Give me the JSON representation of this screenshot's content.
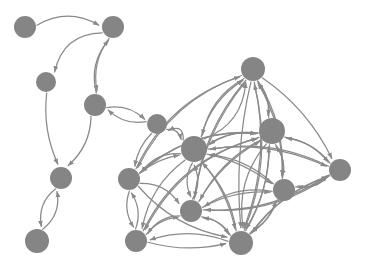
{
  "figure": {
    "type": "directed-graph",
    "title": "",
    "background_color": "#ffffff",
    "node_color": "#858585",
    "edge_color": "#8a8a8a",
    "width": 367,
    "height": 266,
    "node_count": 16,
    "edge_count": 74,
    "directed": true
  },
  "graph_data": {
    "type": "graph",
    "nodes": [
      {
        "id": "n1",
        "label": "",
        "x": 25,
        "y": 27,
        "r": 11
      },
      {
        "id": "n2",
        "label": "",
        "x": 113,
        "y": 27,
        "r": 11
      },
      {
        "id": "n3",
        "label": "",
        "x": 46,
        "y": 82,
        "r": 10
      },
      {
        "id": "n4",
        "label": "",
        "x": 95,
        "y": 105,
        "r": 11
      },
      {
        "id": "n5",
        "label": "",
        "x": 61,
        "y": 178,
        "r": 11
      },
      {
        "id": "n6",
        "label": "",
        "x": 37,
        "y": 241,
        "r": 12
      },
      {
        "id": "n7",
        "label": "",
        "x": 157,
        "y": 124,
        "r": 10
      },
      {
        "id": "n8",
        "label": "",
        "x": 194,
        "y": 149,
        "r": 13
      },
      {
        "id": "n9",
        "label": "",
        "x": 129,
        "y": 179,
        "r": 11
      },
      {
        "id": "n10",
        "label": "",
        "x": 136,
        "y": 241,
        "r": 11
      },
      {
        "id": "n11",
        "label": "",
        "x": 253,
        "y": 69,
        "r": 12
      },
      {
        "id": "n12",
        "label": "",
        "x": 272,
        "y": 131,
        "r": 13
      },
      {
        "id": "n13",
        "label": "",
        "x": 340,
        "y": 170,
        "r": 11
      },
      {
        "id": "n14",
        "label": "",
        "x": 284,
        "y": 190,
        "r": 11
      },
      {
        "id": "n15",
        "label": "",
        "x": 191,
        "y": 211,
        "r": 11
      },
      {
        "id": "n16",
        "label": "",
        "x": 241,
        "y": 243,
        "r": 12
      }
    ],
    "edges": [
      {
        "from": "n1",
        "to": "n2",
        "curve": -18
      },
      {
        "from": "n2",
        "to": "n3",
        "curve": 24
      },
      {
        "from": "n4",
        "to": "n2",
        "curve": -14
      },
      {
        "from": "n2",
        "to": "n4",
        "curve": 12
      },
      {
        "from": "n3",
        "to": "n5",
        "curve": 10
      },
      {
        "from": "n4",
        "to": "n5",
        "curve": -12
      },
      {
        "from": "n5",
        "to": "n6",
        "curve": 12
      },
      {
        "from": "n6",
        "to": "n5",
        "curve": 12
      },
      {
        "from": "n7",
        "to": "n4",
        "curve": -10
      },
      {
        "from": "n4",
        "to": "n7",
        "curve": -10
      },
      {
        "from": "n8",
        "to": "n7",
        "curve": 14
      },
      {
        "from": "n7",
        "to": "n9",
        "curve": 6
      },
      {
        "from": "n8",
        "to": "n9",
        "curve": 12
      },
      {
        "from": "n9",
        "to": "n8",
        "curve": -6
      },
      {
        "from": "n9",
        "to": "n10",
        "curve": 9
      },
      {
        "from": "n10",
        "to": "n9",
        "curve": 9
      },
      {
        "from": "n10",
        "to": "n15",
        "curve": -8
      },
      {
        "from": "n15",
        "to": "n10",
        "curve": 10
      },
      {
        "from": "n8",
        "to": "n15",
        "curve": 9
      },
      {
        "from": "n15",
        "to": "n8",
        "curve": 9
      },
      {
        "from": "n8",
        "to": "n11",
        "curve": -14
      },
      {
        "from": "n11",
        "to": "n8",
        "curve": 16
      },
      {
        "from": "n8",
        "to": "n12",
        "curve": -10
      },
      {
        "from": "n12",
        "to": "n8",
        "curve": 10
      },
      {
        "from": "n8",
        "to": "n13",
        "curve": -18
      },
      {
        "from": "n13",
        "to": "n8",
        "curve": 20
      },
      {
        "from": "n8",
        "to": "n14",
        "curve": -8
      },
      {
        "from": "n14",
        "to": "n8",
        "curve": 12
      },
      {
        "from": "n8",
        "to": "n16",
        "curve": -10
      },
      {
        "from": "n16",
        "to": "n8",
        "curve": 12
      },
      {
        "from": "n11",
        "to": "n12",
        "curve": -8
      },
      {
        "from": "n12",
        "to": "n11",
        "curve": 8
      },
      {
        "from": "n11",
        "to": "n14",
        "curve": -16
      },
      {
        "from": "n14",
        "to": "n11",
        "curve": 14
      },
      {
        "from": "n11",
        "to": "n16",
        "curve": -22
      },
      {
        "from": "n16",
        "to": "n11",
        "curve": 24
      },
      {
        "from": "n11",
        "to": "n15",
        "curve": 20
      },
      {
        "from": "n15",
        "to": "n11",
        "curve": -18
      },
      {
        "from": "n11",
        "to": "n13",
        "curve": -14
      },
      {
        "from": "n12",
        "to": "n13",
        "curve": -10
      },
      {
        "from": "n13",
        "to": "n12",
        "curve": 10
      },
      {
        "from": "n12",
        "to": "n14",
        "curve": -8
      },
      {
        "from": "n14",
        "to": "n12",
        "curve": 8
      },
      {
        "from": "n12",
        "to": "n16",
        "curve": -12
      },
      {
        "from": "n16",
        "to": "n12",
        "curve": 12
      },
      {
        "from": "n12",
        "to": "n15",
        "curve": 14
      },
      {
        "from": "n15",
        "to": "n12",
        "curve": -12
      },
      {
        "from": "n13",
        "to": "n14",
        "curve": -10
      },
      {
        "from": "n14",
        "to": "n13",
        "curve": 10
      },
      {
        "from": "n13",
        "to": "n16",
        "curve": 16
      },
      {
        "from": "n16",
        "to": "n13",
        "curve": -16
      },
      {
        "from": "n14",
        "to": "n16",
        "curve": -8
      },
      {
        "from": "n16",
        "to": "n14",
        "curve": 8
      },
      {
        "from": "n15",
        "to": "n16",
        "curve": -8
      },
      {
        "from": "n16",
        "to": "n15",
        "curve": 8
      },
      {
        "from": "n9",
        "to": "n12",
        "curve": -26
      },
      {
        "from": "n12",
        "to": "n9",
        "curve": 26
      },
      {
        "from": "n9",
        "to": "n11",
        "curve": -30
      },
      {
        "from": "n9",
        "to": "n16",
        "curve": 18
      },
      {
        "from": "n10",
        "to": "n12",
        "curve": -34
      },
      {
        "from": "n10",
        "to": "n16",
        "curve": 10
      },
      {
        "from": "n15",
        "to": "n14",
        "curve": -10
      },
      {
        "from": "n14",
        "to": "n15",
        "curve": 14
      },
      {
        "from": "n7",
        "to": "n8",
        "curve": -8
      },
      {
        "from": "n8",
        "to": "n10",
        "curve": 16
      },
      {
        "from": "n15",
        "to": "n13",
        "curve": 22
      },
      {
        "from": "n16",
        "to": "n10",
        "curve": 14
      },
      {
        "from": "n9",
        "to": "n15",
        "curve": -12
      },
      {
        "from": "n11",
        "to": "n9",
        "curve": 28
      },
      {
        "from": "n12",
        "to": "n10",
        "curve": 32
      },
      {
        "from": "n8",
        "to": "n11",
        "curve": 22
      },
      {
        "from": "n12",
        "to": "n16",
        "curve": 20
      },
      {
        "from": "n11",
        "to": "n16",
        "curve": 12
      },
      {
        "from": "n13",
        "to": "n15",
        "curve": -24
      }
    ]
  }
}
